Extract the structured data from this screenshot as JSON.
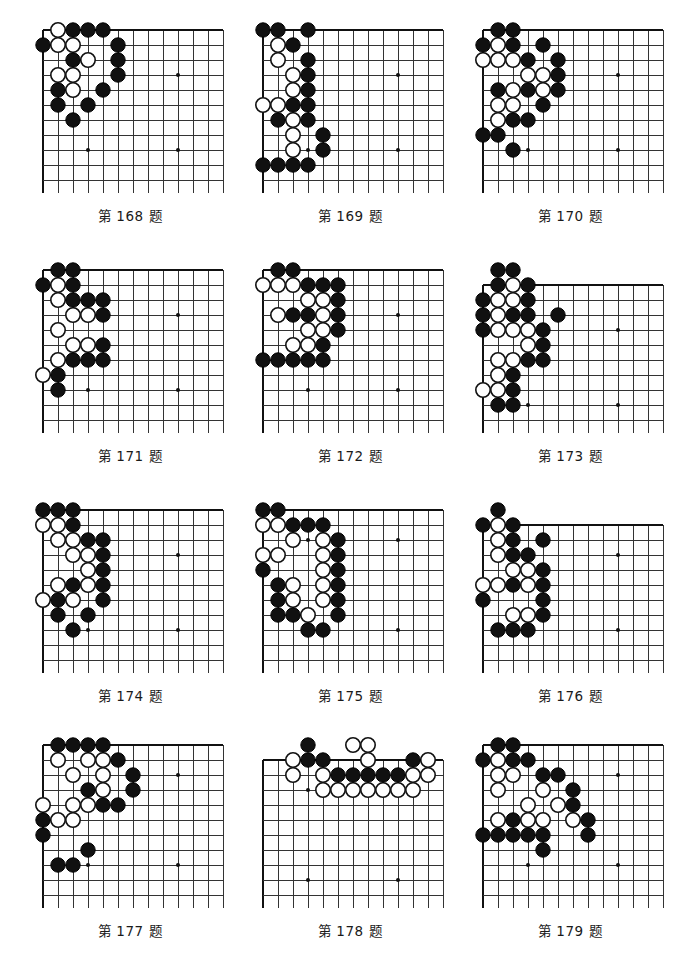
{
  "page": {
    "caption_prefix": "第",
    "caption_suffix": "题",
    "columns": 3,
    "rows": 4,
    "board_grid_cols": 12,
    "board_grid_rows": 11,
    "cell_size": 15,
    "stone_radius": 7.2,
    "colors": {
      "black_stone": "#111111",
      "white_stone": "#ffffff",
      "grid_line": "#333333",
      "edge_line": "#111111",
      "background": "#ffffff",
      "text": "#1a1a1a"
    }
  },
  "problems": [
    {
      "number": "168",
      "caption": "第 168 题",
      "edges": [
        "left",
        "top"
      ],
      "origin_col": 0,
      "origin_row": 0,
      "stars": [
        [
          3,
          8
        ],
        [
          9,
          8
        ],
        [
          9,
          3
        ]
      ],
      "black": [
        [
          2,
          0
        ],
        [
          3,
          0
        ],
        [
          4,
          0
        ],
        [
          0,
          1
        ],
        [
          5,
          1
        ],
        [
          2,
          2
        ],
        [
          5,
          2
        ],
        [
          5,
          3
        ],
        [
          1,
          4
        ],
        [
          4,
          4
        ],
        [
          1,
          5
        ],
        [
          3,
          5
        ],
        [
          2,
          6
        ]
      ],
      "white": [
        [
          1,
          0
        ],
        [
          1,
          1
        ],
        [
          2,
          1
        ],
        [
          3,
          2
        ],
        [
          1,
          3
        ],
        [
          2,
          3
        ],
        [
          2,
          4
        ]
      ]
    },
    {
      "number": "169",
      "caption": "第 169 题",
      "edges": [
        "left",
        "top",
        "bottom"
      ],
      "origin_col": 0,
      "origin_row": 0,
      "stars": [
        [
          9,
          3
        ],
        [
          9,
          8
        ],
        [
          3,
          8
        ]
      ],
      "black": [
        [
          0,
          0
        ],
        [
          1,
          0
        ],
        [
          3,
          0
        ],
        [
          2,
          1
        ],
        [
          3,
          2
        ],
        [
          3,
          3
        ],
        [
          3,
          4
        ],
        [
          2,
          5
        ],
        [
          3,
          5
        ],
        [
          1,
          6
        ],
        [
          3,
          6
        ],
        [
          4,
          7
        ],
        [
          4,
          8
        ],
        [
          0,
          9
        ],
        [
          1,
          9
        ],
        [
          2,
          9
        ],
        [
          3,
          9
        ]
      ],
      "white": [
        [
          1,
          1
        ],
        [
          1,
          2
        ],
        [
          2,
          3
        ],
        [
          2,
          4
        ],
        [
          0,
          5
        ],
        [
          1,
          5
        ],
        [
          2,
          6
        ],
        [
          2,
          7
        ],
        [
          2,
          8
        ]
      ]
    },
    {
      "number": "170",
      "caption": "第 170 题",
      "edges": [
        "left",
        "top"
      ],
      "origin_col": 0,
      "origin_row": 0,
      "stars": [
        [
          9,
          3
        ],
        [
          3,
          8
        ],
        [
          9,
          8
        ]
      ],
      "black": [
        [
          1,
          0
        ],
        [
          2,
          0
        ],
        [
          0,
          1
        ],
        [
          2,
          1
        ],
        [
          4,
          1
        ],
        [
          3,
          2
        ],
        [
          5,
          2
        ],
        [
          5,
          3
        ],
        [
          1,
          4
        ],
        [
          3,
          4
        ],
        [
          5,
          4
        ],
        [
          4,
          5
        ],
        [
          2,
          6
        ],
        [
          3,
          6
        ],
        [
          0,
          7
        ],
        [
          1,
          7
        ],
        [
          2,
          8
        ]
      ],
      "white": [
        [
          1,
          1
        ],
        [
          0,
          2
        ],
        [
          1,
          2
        ],
        [
          2,
          2
        ],
        [
          3,
          3
        ],
        [
          4,
          3
        ],
        [
          2,
          4
        ],
        [
          4,
          4
        ],
        [
          1,
          5
        ],
        [
          2,
          5
        ],
        [
          1,
          6
        ]
      ]
    },
    {
      "number": "171",
      "caption": "第 171 题",
      "edges": [
        "left",
        "top"
      ],
      "origin_col": 0,
      "origin_row": 0,
      "stars": [
        [
          9,
          3
        ],
        [
          3,
          8
        ],
        [
          9,
          8
        ]
      ],
      "black": [
        [
          1,
          0
        ],
        [
          2,
          0
        ],
        [
          0,
          1
        ],
        [
          2,
          1
        ],
        [
          2,
          2
        ],
        [
          3,
          2
        ],
        [
          4,
          2
        ],
        [
          4,
          3
        ],
        [
          4,
          5
        ],
        [
          2,
          6
        ],
        [
          3,
          6
        ],
        [
          4,
          6
        ],
        [
          1,
          7
        ],
        [
          1,
          8
        ]
      ],
      "white": [
        [
          1,
          1
        ],
        [
          1,
          2
        ],
        [
          2,
          3
        ],
        [
          3,
          3
        ],
        [
          1,
          4
        ],
        [
          2,
          5
        ],
        [
          3,
          5
        ],
        [
          1,
          6
        ],
        [
          0,
          7
        ]
      ]
    },
    {
      "number": "172",
      "caption": "第 172 题",
      "edges": [
        "left",
        "top"
      ],
      "origin_col": 0,
      "origin_row": 0,
      "stars": [
        [
          9,
          3
        ],
        [
          3,
          8
        ],
        [
          9,
          8
        ]
      ],
      "black": [
        [
          1,
          0
        ],
        [
          2,
          0
        ],
        [
          3,
          1
        ],
        [
          4,
          1
        ],
        [
          5,
          1
        ],
        [
          5,
          2
        ],
        [
          2,
          3
        ],
        [
          3,
          3
        ],
        [
          5,
          3
        ],
        [
          5,
          4
        ],
        [
          4,
          5
        ],
        [
          0,
          6
        ],
        [
          1,
          6
        ],
        [
          2,
          6
        ],
        [
          3,
          6
        ],
        [
          4,
          6
        ]
      ],
      "white": [
        [
          0,
          1
        ],
        [
          1,
          1
        ],
        [
          2,
          1
        ],
        [
          3,
          2
        ],
        [
          4,
          2
        ],
        [
          1,
          3
        ],
        [
          4,
          3
        ],
        [
          3,
          4
        ],
        [
          4,
          4
        ],
        [
          2,
          5
        ],
        [
          3,
          5
        ]
      ]
    },
    {
      "number": "173",
      "caption": "第 173 题",
      "edges": [
        "left",
        "top"
      ],
      "origin_col": 0,
      "origin_row": -1,
      "stars": [
        [
          9,
          3
        ],
        [
          3,
          8
        ],
        [
          9,
          8
        ]
      ],
      "black": [
        [
          1,
          -1
        ],
        [
          2,
          -1
        ],
        [
          1,
          0
        ],
        [
          3,
          0
        ],
        [
          0,
          1
        ],
        [
          3,
          1
        ],
        [
          0,
          2
        ],
        [
          2,
          2
        ],
        [
          3,
          2
        ],
        [
          5,
          2
        ],
        [
          0,
          3
        ],
        [
          4,
          3
        ],
        [
          4,
          4
        ],
        [
          3,
          5
        ],
        [
          4,
          5
        ],
        [
          2,
          6
        ],
        [
          2,
          7
        ],
        [
          1,
          8
        ],
        [
          2,
          8
        ]
      ],
      "white": [
        [
          2,
          0
        ],
        [
          1,
          1
        ],
        [
          2,
          1
        ],
        [
          1,
          2
        ],
        [
          1,
          3
        ],
        [
          2,
          3
        ],
        [
          3,
          3
        ],
        [
          3,
          4
        ],
        [
          1,
          5
        ],
        [
          2,
          5
        ],
        [
          1,
          6
        ],
        [
          0,
          7
        ],
        [
          1,
          7
        ]
      ]
    },
    {
      "number": "174",
      "caption": "第 174 题",
      "edges": [
        "left",
        "top"
      ],
      "origin_col": 0,
      "origin_row": 0,
      "stars": [
        [
          9,
          3
        ],
        [
          3,
          8
        ],
        [
          9,
          8
        ]
      ],
      "black": [
        [
          0,
          0
        ],
        [
          1,
          0
        ],
        [
          2,
          0
        ],
        [
          2,
          1
        ],
        [
          3,
          2
        ],
        [
          4,
          2
        ],
        [
          4,
          3
        ],
        [
          4,
          4
        ],
        [
          2,
          5
        ],
        [
          4,
          5
        ],
        [
          1,
          6
        ],
        [
          4,
          6
        ],
        [
          1,
          7
        ],
        [
          3,
          7
        ],
        [
          2,
          8
        ]
      ],
      "white": [
        [
          0,
          1
        ],
        [
          1,
          1
        ],
        [
          1,
          2
        ],
        [
          2,
          2
        ],
        [
          2,
          3
        ],
        [
          3,
          3
        ],
        [
          3,
          4
        ],
        [
          1,
          5
        ],
        [
          3,
          5
        ],
        [
          0,
          6
        ],
        [
          2,
          6
        ]
      ]
    },
    {
      "number": "175",
      "caption": "第 175 题",
      "edges": [
        "left",
        "top"
      ],
      "origin_col": 0,
      "origin_row": 0,
      "stars": [
        [
          3,
          2
        ],
        [
          9,
          2
        ],
        [
          9,
          8
        ]
      ],
      "black": [
        [
          0,
          0
        ],
        [
          1,
          0
        ],
        [
          2,
          1
        ],
        [
          3,
          1
        ],
        [
          4,
          1
        ],
        [
          5,
          2
        ],
        [
          5,
          3
        ],
        [
          0,
          4
        ],
        [
          5,
          4
        ],
        [
          1,
          5
        ],
        [
          5,
          5
        ],
        [
          1,
          6
        ],
        [
          5,
          6
        ],
        [
          1,
          7
        ],
        [
          2,
          7
        ],
        [
          5,
          7
        ],
        [
          3,
          8
        ],
        [
          4,
          8
        ]
      ],
      "white": [
        [
          0,
          1
        ],
        [
          1,
          1
        ],
        [
          2,
          2
        ],
        [
          4,
          2
        ],
        [
          0,
          3
        ],
        [
          1,
          3
        ],
        [
          4,
          3
        ],
        [
          4,
          4
        ],
        [
          2,
          5
        ],
        [
          4,
          5
        ],
        [
          2,
          6
        ],
        [
          4,
          6
        ],
        [
          3,
          7
        ]
      ]
    },
    {
      "number": "176",
      "caption": "第 176 题",
      "edges": [
        "left",
        "top"
      ],
      "origin_col": 0,
      "origin_row": -1,
      "stars": [
        [
          9,
          2
        ],
        [
          3,
          7
        ],
        [
          9,
          7
        ]
      ],
      "black": [
        [
          1,
          -1
        ],
        [
          0,
          0
        ],
        [
          2,
          0
        ],
        [
          2,
          1
        ],
        [
          4,
          1
        ],
        [
          2,
          2
        ],
        [
          3,
          2
        ],
        [
          4,
          3
        ],
        [
          2,
          4
        ],
        [
          4,
          4
        ],
        [
          0,
          5
        ],
        [
          4,
          5
        ],
        [
          4,
          6
        ],
        [
          1,
          7
        ],
        [
          2,
          7
        ],
        [
          3,
          7
        ]
      ],
      "white": [
        [
          1,
          0
        ],
        [
          1,
          1
        ],
        [
          1,
          2
        ],
        [
          2,
          3
        ],
        [
          3,
          3
        ],
        [
          0,
          4
        ],
        [
          1,
          4
        ],
        [
          3,
          4
        ],
        [
          2,
          6
        ],
        [
          3,
          6
        ]
      ]
    },
    {
      "number": "177",
      "caption": "第 177 题",
      "edges": [
        "left",
        "top"
      ],
      "origin_col": 0,
      "origin_row": 0,
      "stars": [
        [
          2,
          2
        ],
        [
          9,
          2
        ],
        [
          3,
          8
        ],
        [
          9,
          8
        ]
      ],
      "black": [
        [
          1,
          0
        ],
        [
          2,
          0
        ],
        [
          3,
          0
        ],
        [
          4,
          0
        ],
        [
          5,
          1
        ],
        [
          6,
          2
        ],
        [
          3,
          3
        ],
        [
          6,
          3
        ],
        [
          4,
          4
        ],
        [
          5,
          4
        ],
        [
          0,
          5
        ],
        [
          0,
          6
        ],
        [
          3,
          7
        ],
        [
          1,
          8
        ],
        [
          2,
          8
        ]
      ],
      "white": [
        [
          1,
          1
        ],
        [
          3,
          1
        ],
        [
          4,
          1
        ],
        [
          2,
          2
        ],
        [
          4,
          2
        ],
        [
          4,
          3
        ],
        [
          0,
          4
        ],
        [
          2,
          4
        ],
        [
          3,
          4
        ],
        [
          1,
          5
        ],
        [
          2,
          5
        ]
      ]
    },
    {
      "number": "178",
      "caption": "第 178 题",
      "edges": [
        "left",
        "top"
      ],
      "origin_col": 0,
      "origin_row": -1,
      "stars": [
        [
          3,
          2
        ],
        [
          3,
          8
        ],
        [
          9,
          8
        ]
      ],
      "black": [
        [
          3,
          -1
        ],
        [
          3,
          0
        ],
        [
          4,
          0
        ],
        [
          10,
          0
        ],
        [
          5,
          1
        ],
        [
          6,
          1
        ],
        [
          7,
          1
        ],
        [
          8,
          1
        ],
        [
          9,
          1
        ]
      ],
      "white": [
        [
          6,
          -1
        ],
        [
          7,
          -1
        ],
        [
          2,
          0
        ],
        [
          7,
          0
        ],
        [
          11,
          0
        ],
        [
          2,
          1
        ],
        [
          4,
          1
        ],
        [
          10,
          1
        ],
        [
          11,
          1
        ],
        [
          4,
          2
        ],
        [
          5,
          2
        ],
        [
          6,
          2
        ],
        [
          7,
          2
        ],
        [
          8,
          2
        ],
        [
          9,
          2
        ],
        [
          10,
          2
        ]
      ]
    },
    {
      "number": "179",
      "caption": "第 179 题",
      "edges": [
        "left",
        "top"
      ],
      "origin_col": 0,
      "origin_row": 0,
      "stars": [
        [
          2,
          2
        ],
        [
          9,
          2
        ],
        [
          3,
          8
        ],
        [
          9,
          8
        ]
      ],
      "black": [
        [
          1,
          0
        ],
        [
          2,
          0
        ],
        [
          0,
          1
        ],
        [
          2,
          1
        ],
        [
          3,
          1
        ],
        [
          4,
          2
        ],
        [
          5,
          2
        ],
        [
          6,
          3
        ],
        [
          6,
          4
        ],
        [
          2,
          5
        ],
        [
          7,
          5
        ],
        [
          0,
          6
        ],
        [
          1,
          6
        ],
        [
          2,
          6
        ],
        [
          3,
          6
        ],
        [
          4,
          6
        ],
        [
          7,
          6
        ],
        [
          4,
          7
        ]
      ],
      "white": [
        [
          1,
          1
        ],
        [
          1,
          2
        ],
        [
          2,
          2
        ],
        [
          1,
          3
        ],
        [
          4,
          3
        ],
        [
          3,
          4
        ],
        [
          5,
          4
        ],
        [
          1,
          5
        ],
        [
          3,
          5
        ],
        [
          4,
          5
        ],
        [
          6,
          5
        ]
      ]
    }
  ]
}
